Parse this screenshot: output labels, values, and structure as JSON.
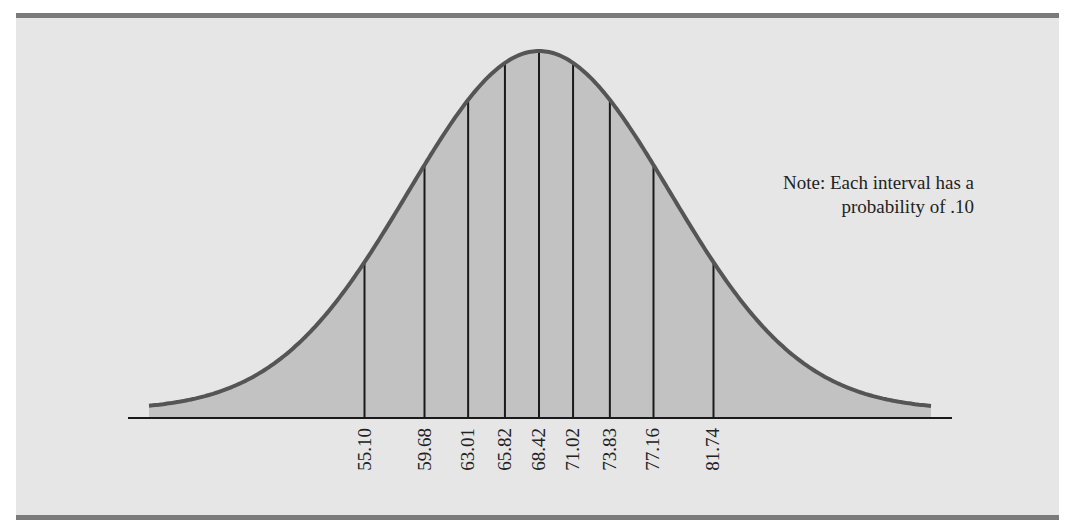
{
  "chart_data": {
    "type": "area",
    "title": "",
    "xlabel": "",
    "ylabel": "",
    "distribution": "normal",
    "mean": 68.42,
    "std_dev": 10,
    "interval_probability": 0.1,
    "tick_labels": [
      "55.10",
      "59.68",
      "63.01",
      "65.82",
      "68.42",
      "71.02",
      "73.83",
      "77.16",
      "81.74"
    ],
    "x": [
      55.1,
      59.68,
      63.01,
      65.82,
      68.42,
      71.02,
      73.83,
      77.16,
      81.74
    ],
    "annotation": "Note: Each interval has a probability of .10",
    "grid": false,
    "legend": null
  },
  "note": {
    "line1": "Note: Each interval has a",
    "line2": "probability of .10"
  },
  "colors": {
    "background": "#e6e6e6",
    "fill": "#c2c2c2",
    "curve": "#555555",
    "border": "#7a7a7a",
    "lines": "#1a1a1a"
  }
}
